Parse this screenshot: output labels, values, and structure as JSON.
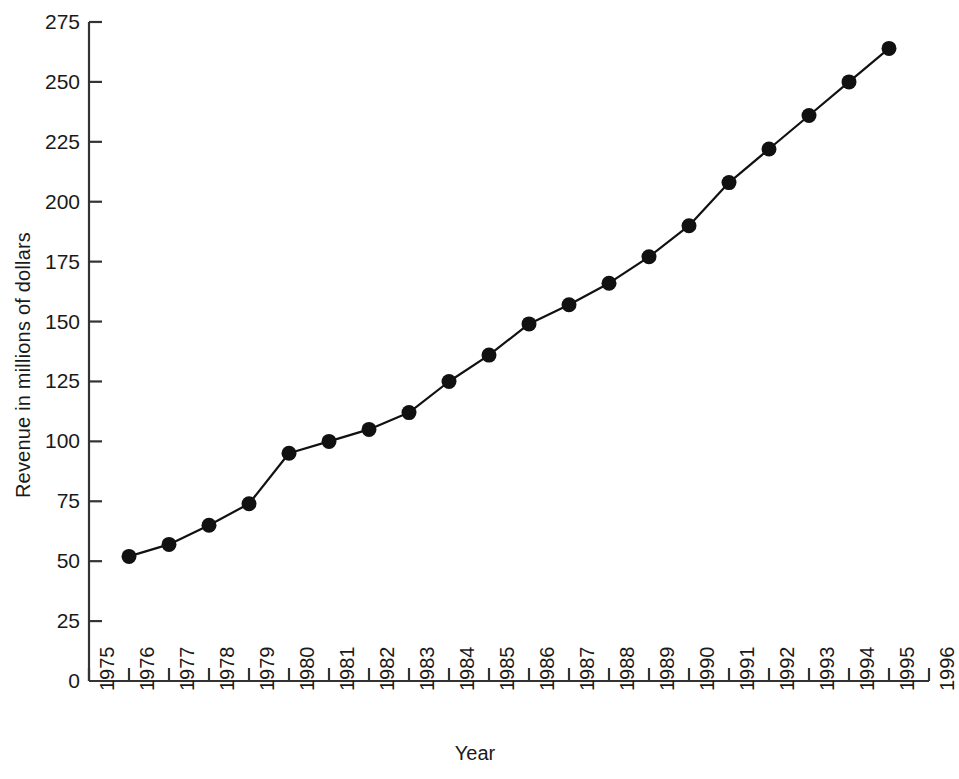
{
  "chart_data": {
    "type": "line",
    "title": "",
    "subtitle": "",
    "xlabel": "Year",
    "ylabel": "Revenue in millions of dollars",
    "x": [
      1976,
      1977,
      1978,
      1979,
      1980,
      1981,
      1982,
      1983,
      1984,
      1985,
      1986,
      1987,
      1988,
      1989,
      1990,
      1991,
      1992,
      1993,
      1994,
      1995
    ],
    "values": [
      52,
      57,
      65,
      74,
      95,
      100,
      105,
      112,
      125,
      136,
      149,
      157,
      166,
      177,
      190,
      208,
      222,
      236,
      250,
      264
    ],
    "xlim": [
      1975,
      1996
    ],
    "ylim": [
      0,
      275
    ],
    "xticks": [
      1975,
      1976,
      1977,
      1978,
      1979,
      1980,
      1981,
      1982,
      1983,
      1984,
      1985,
      1986,
      1987,
      1988,
      1989,
      1990,
      1991,
      1992,
      1993,
      1994,
      1995,
      1996
    ],
    "xticklabels": [
      "1975",
      "1976",
      "1977",
      "1978",
      "1979",
      "1980",
      "1981",
      "1982",
      "1983",
      "1984",
      "1985",
      "1986",
      "1987",
      "1988",
      "1989",
      "1990",
      "1991",
      "1992",
      "1993",
      "1994",
      "1995",
      "1996"
    ],
    "yticks": [
      0,
      25,
      50,
      75,
      100,
      125,
      150,
      175,
      200,
      225,
      250,
      275
    ],
    "yticklabels": [
      "0",
      "25",
      "50",
      "75",
      "100",
      "125",
      "150",
      "175",
      "200",
      "225",
      "250",
      "275"
    ],
    "grid": false,
    "legend": null,
    "marker": "filled-circle",
    "series_color": "#111111",
    "axis_color": "#333333",
    "background": "#ffffff",
    "xtick_label_rotation": -90,
    "annotations": []
  }
}
